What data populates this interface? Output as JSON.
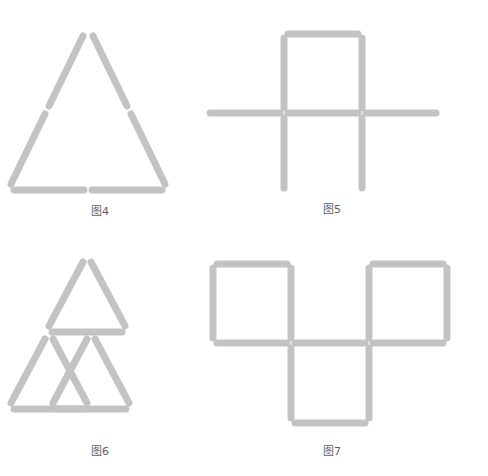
{
  "page": {
    "background_color": "#ffffff",
    "width": 488,
    "height": 476
  },
  "style": {
    "stick_color": "#c3c3c3",
    "stick_color_light": "#cfcfcf",
    "stick_thickness": 7,
    "caption_color": "#5f5f5f"
  },
  "figures": [
    {
      "id": "fig4",
      "caption": "图4",
      "shape": "large-triangle",
      "description": "A large equilateral triangle outline built from 6 matchsticks, two per side.",
      "stick_count": 6,
      "triangle_count": 1,
      "sticks": [
        {
          "name": "left-side-upper",
          "x1": 83,
          "y1": 22,
          "x2": 49,
          "y2": 92
        },
        {
          "name": "left-side-lower",
          "x1": 45,
          "y1": 100,
          "x2": 11,
          "y2": 170
        },
        {
          "name": "right-side-upper",
          "x1": 93,
          "y1": 22,
          "x2": 127,
          "y2": 92
        },
        {
          "name": "right-side-lower",
          "x1": 131,
          "y1": 100,
          "x2": 165,
          "y2": 170
        },
        {
          "name": "base-left",
          "x1": 14,
          "y1": 176,
          "x2": 84,
          "y2": 176
        },
        {
          "name": "base-right",
          "x1": 92,
          "y1": 176,
          "x2": 162,
          "y2": 176
        }
      ]
    },
    {
      "id": "fig5",
      "caption": "图5",
      "shape": "square-over-cross",
      "description": "One square on top sitting on a long horizontal line of three matchsticks, with two vertical matchsticks hanging below the square's corners, forming a cross-like figure.",
      "stick_count": 8,
      "square_count": 1,
      "sticks": [
        {
          "name": "square-top",
          "x1": 88,
          "y1": 20,
          "x2": 158,
          "y2": 20
        },
        {
          "name": "square-left",
          "x1": 84,
          "y1": 24,
          "x2": 84,
          "y2": 94
        },
        {
          "name": "square-right",
          "x1": 162,
          "y1": 24,
          "x2": 162,
          "y2": 94
        },
        {
          "name": "horizontal-left",
          "x1": 10,
          "y1": 99,
          "x2": 80,
          "y2": 99
        },
        {
          "name": "horizontal-middle",
          "x1": 88,
          "y1": 99,
          "x2": 158,
          "y2": 99
        },
        {
          "name": "horizontal-right",
          "x1": 166,
          "y1": 99,
          "x2": 236,
          "y2": 99
        },
        {
          "name": "vertical-below-left",
          "x1": 84,
          "y1": 104,
          "x2": 84,
          "y2": 174
        },
        {
          "name": "vertical-below-right",
          "x1": 162,
          "y1": 104,
          "x2": 162,
          "y2": 174
        }
      ]
    },
    {
      "id": "fig6",
      "caption": "图6",
      "shape": "three-small-triangles",
      "description": "Three small triangles arranged in a triangular cluster: one on top, two below side by side. Nine matchsticks in total.",
      "stick_count": 9,
      "triangle_count": 3,
      "sticks": [
        {
          "name": "top-triangle-left",
          "x1": 83,
          "y1": 14,
          "x2": 49,
          "y2": 78
        },
        {
          "name": "top-triangle-right",
          "x1": 91,
          "y1": 14,
          "x2": 125,
          "y2": 78
        },
        {
          "name": "top-triangle-base",
          "x1": 52,
          "y1": 84,
          "x2": 122,
          "y2": 84
        },
        {
          "name": "bottom-left-tri-left",
          "x1": 45,
          "y1": 91,
          "x2": 11,
          "y2": 155
        },
        {
          "name": "bottom-left-tri-right",
          "x1": 53,
          "y1": 91,
          "x2": 87,
          "y2": 155
        },
        {
          "name": "bottom-left-tri-base",
          "x1": 14,
          "y1": 161,
          "x2": 84,
          "y2": 161
        },
        {
          "name": "bottom-right-tri-left",
          "x1": 87,
          "y1": 91,
          "x2": 53,
          "y2": 155
        },
        {
          "name": "bottom-right-tri-right",
          "x1": 95,
          "y1": 91,
          "x2": 129,
          "y2": 155
        },
        {
          "name": "bottom-right-tri-base",
          "x1": 56,
          "y1": 161,
          "x2": 126,
          "y2": 161
        }
      ]
    },
    {
      "id": "fig7",
      "caption": "图7",
      "shape": "three-squares-staggered",
      "description": "Three squares arranged in a staircase: two squares on the top row side by side and one square below, centered between them.",
      "stick_count": 10,
      "square_count": 3,
      "sticks": [
        {
          "name": "top-left-square-top",
          "x1": 22,
          "y1": 16,
          "x2": 92,
          "y2": 16
        },
        {
          "name": "top-left-square-left",
          "x1": 18,
          "y1": 20,
          "x2": 18,
          "y2": 90
        },
        {
          "name": "top-left-square-right",
          "x1": 96,
          "y1": 20,
          "x2": 96,
          "y2": 90
        },
        {
          "name": "top-left-square-bottom",
          "x1": 22,
          "y1": 95,
          "x2": 92,
          "y2": 95
        },
        {
          "name": "top-right-square-top",
          "x1": 178,
          "y1": 16,
          "x2": 248,
          "y2": 16
        },
        {
          "name": "top-right-square-left",
          "x1": 174,
          "y1": 20,
          "x2": 174,
          "y2": 90
        },
        {
          "name": "top-right-square-right",
          "x1": 252,
          "y1": 20,
          "x2": 252,
          "y2": 90
        },
        {
          "name": "shared-middle-horizontal",
          "x1": 100,
          "y1": 95,
          "x2": 170,
          "y2": 95
        },
        {
          "name": "top-right-square-bottom",
          "x1": 178,
          "y1": 95,
          "x2": 248,
          "y2": 95
        },
        {
          "name": "bottom-square-left",
          "x1": 96,
          "y1": 100,
          "x2": 96,
          "y2": 170
        },
        {
          "name": "bottom-square-right",
          "x1": 174,
          "y1": 100,
          "x2": 174,
          "y2": 170
        },
        {
          "name": "bottom-square-bottom",
          "x1": 100,
          "y1": 175,
          "x2": 170,
          "y2": 175
        }
      ]
    }
  ]
}
